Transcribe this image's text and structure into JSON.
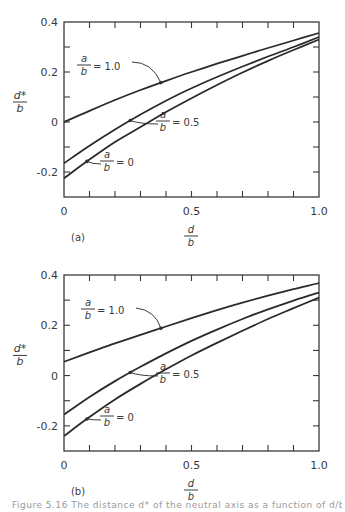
{
  "chart_data": [
    {
      "type": "line",
      "panel_label": "(a)",
      "xlabel_num": "d",
      "xlabel_den": "b",
      "ylabel_num": "d*",
      "ylabel_den": "b",
      "xlim": [
        0,
        1.0
      ],
      "ylim": [
        -0.3,
        0.4
      ],
      "xticks": [
        0,
        0.5,
        1.0
      ],
      "xtick_labels": [
        "0",
        "0.5",
        "1.0"
      ],
      "yticks": [
        -0.2,
        0,
        0.2,
        0.4
      ],
      "ytick_labels": [
        "-0.2",
        "0",
        "0.2",
        "0.4"
      ],
      "grid": false,
      "frame": {
        "x0": 64,
        "y0": 22,
        "x1": 319,
        "y1": 197
      },
      "series": [
        {
          "name": "a/b = 1.0",
          "label_num": "a",
          "label_den": "b",
          "label_val": "= 1.0",
          "x": [
            0,
            0.1,
            0.2,
            0.3,
            0.4,
            0.5,
            0.6,
            0.7,
            0.8,
            0.9,
            1.0
          ],
          "y": [
            0.0,
            0.045,
            0.088,
            0.128,
            0.165,
            0.2,
            0.233,
            0.265,
            0.296,
            0.326,
            0.356
          ],
          "marker_x": 0.38,
          "label_pos": [
            84,
            62
          ],
          "leader": [
            [
              132,
              62
            ],
            [
              152,
              62
            ],
            [
              161,
              80
            ]
          ]
        },
        {
          "name": "a/b = 0.5",
          "label_num": "a",
          "label_den": "b",
          "label_val": "= 0.5",
          "x": [
            0,
            0.1,
            0.2,
            0.3,
            0.4,
            0.5,
            0.6,
            0.7,
            0.8,
            0.9,
            1.0
          ],
          "y": [
            -0.165,
            -0.095,
            -0.03,
            0.03,
            0.085,
            0.135,
            0.18,
            0.222,
            0.262,
            0.3,
            0.34
          ],
          "marker_x": 0.26,
          "label_pos": [
            163,
            118
          ],
          "leader": [
            [
              158,
              124
            ],
            [
              140,
              124
            ],
            [
              131,
              113
            ]
          ]
        },
        {
          "name": "a/b = 0",
          "label_num": "a",
          "label_den": "b",
          "label_val": "= 0",
          "x": [
            0,
            0.1,
            0.2,
            0.3,
            0.4,
            0.5,
            0.6,
            0.7,
            0.8,
            0.9,
            1.0
          ],
          "y": [
            -0.225,
            -0.15,
            -0.08,
            -0.02,
            0.04,
            0.095,
            0.148,
            0.198,
            0.245,
            0.288,
            0.33
          ],
          "marker_x": 0.09,
          "label_pos": [
            107,
            158
          ],
          "leader": [
            [
              101,
              164
            ],
            [
              92,
              164
            ],
            [
              86,
              156
            ]
          ]
        }
      ]
    },
    {
      "type": "line",
      "panel_label": "(b)",
      "xlabel_num": "d",
      "xlabel_den": "b",
      "ylabel_num": "d*",
      "ylabel_den": "b",
      "xlim": [
        0,
        1.0
      ],
      "ylim": [
        -0.3,
        0.4
      ],
      "xticks": [
        0,
        0.5,
        1.0
      ],
      "xtick_labels": [
        "0",
        "0.5",
        "1.0"
      ],
      "yticks": [
        -0.2,
        0,
        0.2,
        0.4
      ],
      "ytick_labels": [
        "-0.2",
        "0",
        "0.2",
        "0.4"
      ],
      "grid": false,
      "frame": {
        "x0": 64,
        "y0": 275,
        "x1": 319,
        "y1": 451
      },
      "series": [
        {
          "name": "a/b = 1.0",
          "label_num": "a",
          "label_den": "b",
          "label_val": "= 1.0",
          "x": [
            0,
            0.1,
            0.2,
            0.3,
            0.4,
            0.5,
            0.6,
            0.7,
            0.8,
            0.9,
            1.0
          ],
          "y": [
            0.055,
            0.092,
            0.128,
            0.162,
            0.195,
            0.228,
            0.26,
            0.29,
            0.318,
            0.344,
            0.368
          ],
          "marker_x": 0.38,
          "label_pos": [
            88,
            306
          ],
          "leader": [
            [
              136,
              308
            ],
            [
              155,
              310
            ],
            [
              162,
              327
            ]
          ]
        },
        {
          "name": "a/b = 0.5",
          "label_num": "a",
          "label_den": "b",
          "label_val": "= 0.5",
          "x": [
            0,
            0.1,
            0.2,
            0.3,
            0.4,
            0.5,
            0.6,
            0.7,
            0.8,
            0.9,
            1.0
          ],
          "y": [
            -0.155,
            -0.085,
            -0.022,
            0.035,
            0.088,
            0.138,
            0.183,
            0.225,
            0.263,
            0.298,
            0.33
          ],
          "marker_x": 0.26,
          "label_pos": [
            163,
            370
          ],
          "leader": [
            [
              158,
              376
            ],
            [
              140,
              376
            ],
            [
              132,
              360
            ]
          ]
        },
        {
          "name": "a/b = 0",
          "label_num": "a",
          "label_den": "b",
          "label_val": "= 0",
          "x": [
            0,
            0.1,
            0.2,
            0.3,
            0.4,
            0.5,
            0.6,
            0.7,
            0.8,
            0.9,
            1.0
          ],
          "y": [
            -0.24,
            -0.165,
            -0.095,
            -0.033,
            0.025,
            0.08,
            0.13,
            0.178,
            0.225,
            0.268,
            0.31
          ],
          "marker_x": 0.09,
          "label_pos": [
            107,
            413
          ],
          "leader": [
            [
              101,
              420
            ],
            [
              92,
              420
            ],
            [
              87,
              410
            ]
          ]
        }
      ]
    }
  ],
  "caption": "Figure 5.16  The distance d* of the neutral axis as a function of d/b and a/b"
}
